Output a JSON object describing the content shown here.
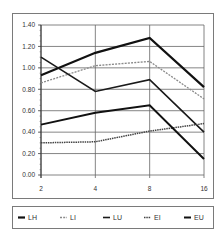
{
  "chart_data": {
    "type": "line",
    "title": "",
    "xlabel": "",
    "ylabel": "",
    "x": [
      "2",
      "4",
      "8",
      "16"
    ],
    "ylim": [
      0,
      1.4
    ],
    "yticks": [
      "0.00",
      "0.20",
      "0.40",
      "0.60",
      "0.80",
      "1.00",
      "1.20",
      "1.40"
    ],
    "ytick_values": [
      0,
      0.2,
      0.4,
      0.6,
      0.8,
      1.0,
      1.2,
      1.4
    ],
    "grid": true,
    "legend_position": "bottom",
    "series": [
      {
        "name": "LH",
        "values": [
          0.93,
          1.14,
          1.28,
          0.82
        ],
        "color": "#111111",
        "width": 2.2,
        "dash": ""
      },
      {
        "name": "LI",
        "values": [
          0.86,
          1.02,
          1.06,
          0.71
        ],
        "color": "#8a8a8a",
        "width": 1.3,
        "dash": "2,1.2"
      },
      {
        "name": "LU",
        "values": [
          1.1,
          0.78,
          0.89,
          0.4
        ],
        "color": "#1a1a1a",
        "width": 1.6,
        "dash": ""
      },
      {
        "name": "EI",
        "values": [
          0.3,
          0.31,
          0.41,
          0.48
        ],
        "color": "#444444",
        "width": 1.5,
        "dash": "1.5,0.8"
      },
      {
        "name": "EU",
        "values": [
          0.47,
          0.58,
          0.65,
          0.15
        ],
        "color": "#111111",
        "width": 2.0,
        "dash": ""
      }
    ]
  },
  "legend": {
    "items": [
      "LH",
      "LI",
      "LU",
      "EI",
      "EU"
    ]
  }
}
